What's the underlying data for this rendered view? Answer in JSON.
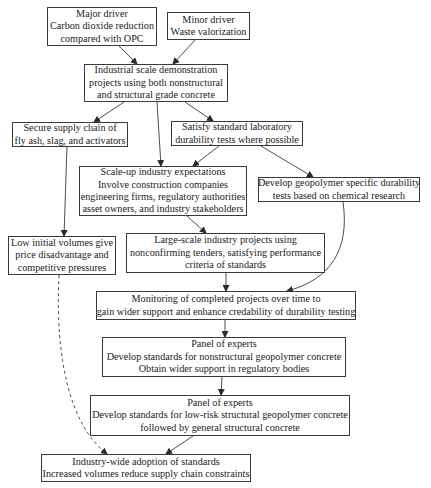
{
  "diagram": {
    "type": "flowchart",
    "nodes": {
      "major_driver": {
        "lines": [
          "Major driver",
          "Carbon dioxide reduction",
          "compared with OPC"
        ]
      },
      "minor_driver": {
        "lines": [
          "Minor driver",
          "Waste valorization"
        ]
      },
      "demonstration": {
        "lines": [
          "Industrial scale demonstration",
          "projects using both nonstructural",
          "and structural grade concrete"
        ]
      },
      "supply_chain": {
        "lines": [
          "Secure supply chain of",
          "fly ash, slag, and activators"
        ]
      },
      "durability_tests": {
        "lines": [
          "Satisfy standard laboratory",
          "durability tests where possible"
        ]
      },
      "scale_up": {
        "lines": [
          "Scale-up industry expectations",
          "Involve construction companies",
          "engineering firms, regulatory authorities",
          "asset owners, and industry stakeholders"
        ]
      },
      "geopolymer_tests": {
        "lines": [
          "Develop geopolymer specific durability",
          "tests based on chemical research"
        ]
      },
      "low_volumes": {
        "lines": [
          "Low initial volumes give",
          "price disadvantage and",
          "competitive pressures"
        ]
      },
      "large_scale": {
        "lines": [
          "Large-scale industry projects using",
          "nonconfirming tenders, satisfying performance",
          "criteria of standards"
        ]
      },
      "monitoring": {
        "lines": [
          "Monitoring of completed projects over time to",
          "gain wider support and enhance credability of durability testing"
        ]
      },
      "panel_nonstructural": {
        "lines": [
          "Panel of experts",
          "Develop standards for nonstructural geopolymer concrete",
          "Obtain wider support in regulatory bodies"
        ]
      },
      "panel_structural": {
        "lines": [
          "Panel of experts",
          "Develop standards for low-risk structural geopolymer concrete",
          "followed by general structural concrete"
        ]
      },
      "adoption": {
        "lines": [
          "Industry-wide adoption of standards",
          "Increased volumes reduce supply chain constraints"
        ]
      }
    },
    "edges": [
      {
        "from": "major_driver",
        "to": "demonstration",
        "style": "solid"
      },
      {
        "from": "minor_driver",
        "to": "demonstration",
        "style": "solid"
      },
      {
        "from": "demonstration",
        "to": "supply_chain",
        "style": "solid"
      },
      {
        "from": "demonstration",
        "to": "scale_up",
        "style": "solid"
      },
      {
        "from": "demonstration",
        "to": "durability_tests",
        "style": "solid"
      },
      {
        "from": "durability_tests",
        "to": "scale_up",
        "style": "solid"
      },
      {
        "from": "durability_tests",
        "to": "geopolymer_tests",
        "style": "solid"
      },
      {
        "from": "supply_chain",
        "to": "low_volumes",
        "style": "solid"
      },
      {
        "from": "scale_up",
        "to": "large_scale",
        "style": "solid"
      },
      {
        "from": "large_scale",
        "to": "monitoring",
        "style": "solid"
      },
      {
        "from": "geopolymer_tests",
        "to": "monitoring",
        "style": "solid-curved"
      },
      {
        "from": "monitoring",
        "to": "panel_nonstructural",
        "style": "solid"
      },
      {
        "from": "panel_nonstructural",
        "to": "panel_structural",
        "style": "solid"
      },
      {
        "from": "panel_structural",
        "to": "adoption",
        "style": "solid"
      },
      {
        "from": "low_volumes",
        "to": "adoption",
        "style": "dashed-curved"
      }
    ],
    "colors": {
      "line": "#3a3a3a",
      "text": "#222222",
      "background": "#ffffff"
    }
  }
}
